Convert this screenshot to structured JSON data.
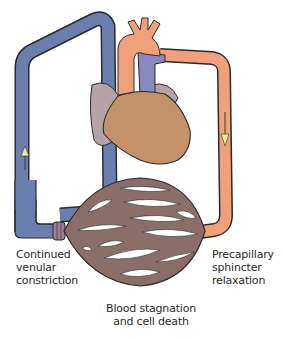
{
  "figure": {
    "type": "circulatory-shock-capillary-diagram",
    "labels": {
      "left": [
        "Continued",
        "venular",
        "constriction"
      ],
      "right": [
        "Precapillary",
        "sphincter",
        "relaxation"
      ],
      "bottom": [
        "Blood stagnation",
        "and cell death"
      ]
    },
    "flow_arrows": {
      "venous_side": "up",
      "arterial_side": "down"
    },
    "colors": {
      "venous": "#6a7fae",
      "arterial": "#f0a07a",
      "heart": "#c4926a",
      "right_atrium": "#b6a3a8",
      "pulmonary": "#8a88c0",
      "capillary_bed": "#8c6e68",
      "outline": "#2b2b2b",
      "arrow": "#e8e89a"
    }
  }
}
